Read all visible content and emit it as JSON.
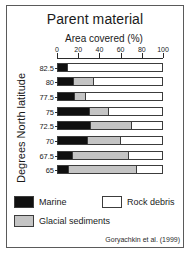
{
  "chart_data": {
    "type": "bar",
    "orientation": "horizontal",
    "stacked": true,
    "normalized_percent": true,
    "title": "Parent material",
    "xlabel": "Area covered (%)",
    "ylabel": "Degrees North latitude",
    "xlim": [
      0,
      100
    ],
    "xticks": [
      0,
      20,
      40,
      60,
      80,
      100
    ],
    "xtick_labels": [
      "0",
      "20",
      "40",
      "60",
      "80",
      "100"
    ],
    "grid": false,
    "legend_position": "below-axes",
    "categories": [
      "82.5",
      "80",
      "77.5",
      "75",
      "72.5",
      "70",
      "67.5",
      "65"
    ],
    "series": [
      {
        "name": "Marine",
        "color": "#101010",
        "values": [
          10,
          15,
          16,
          31,
          32,
          29,
          14,
          11
        ]
      },
      {
        "name": "Glacial sediments",
        "color": "#c4c4c4",
        "values": [
          0,
          20,
          11,
          18,
          39,
          32,
          54,
          65
        ]
      },
      {
        "name": "Rock debris",
        "color": "#ffffff",
        "values": [
          90,
          65,
          73,
          51,
          29,
          39,
          32,
          24
        ]
      }
    ],
    "annotations": [
      "Goryachkin et al. (1999)"
    ]
  },
  "title": "Parent material",
  "axes": {
    "x_title": "Area covered (%)",
    "y_title": "Degrees North latitude",
    "x_ticks": [
      "0",
      "20",
      "40",
      "60",
      "80",
      "100"
    ],
    "y_ticks": [
      "82.5",
      "80",
      "77.5",
      "75",
      "72.5",
      "70",
      "67.5",
      "65"
    ]
  },
  "legend": {
    "items": [
      {
        "label": "Marine",
        "color": "#101010"
      },
      {
        "label": "Rock debris",
        "color": "#ffffff"
      },
      {
        "label": "Glacial sediments",
        "color": "#c4c4c4"
      }
    ]
  },
  "citation": "Goryachkin et al. (1999)"
}
